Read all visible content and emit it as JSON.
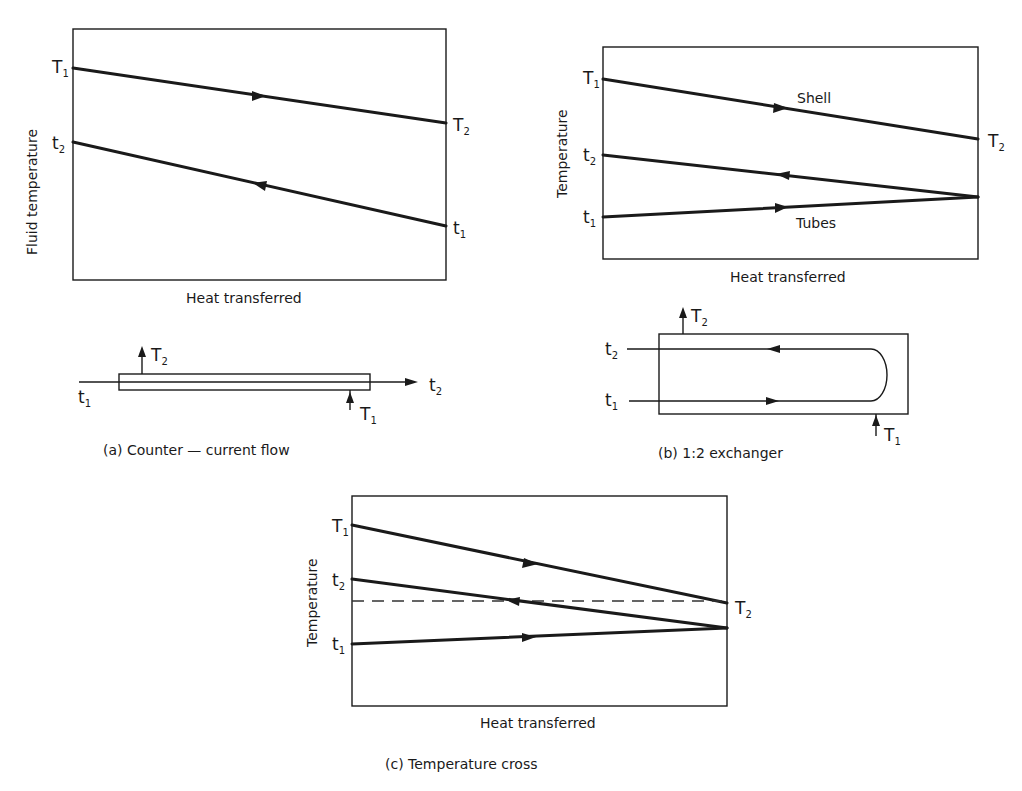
{
  "figure_a": {
    "caption": "(a)  Counter — current flow",
    "y_axis_label": "Fluid temperature",
    "x_axis_label": "Heat transferred",
    "labels": {
      "T1_main": "T",
      "T1_sub": "1",
      "T2_main": "T",
      "T2_sub": "2",
      "t2_main": "t",
      "t2_sub": "2",
      "t1_main": "t",
      "t1_sub": "1"
    },
    "schematic": {
      "T2_main": "T",
      "T2_sub": "2",
      "t1_main": "t",
      "t1_sub": "1",
      "t2_main": "t",
      "t2_sub": "2",
      "T1_main": "T",
      "T1_sub": "1"
    }
  },
  "figure_b": {
    "caption": "(b)  1:2 exchanger",
    "y_axis_label": "Temperature",
    "x_axis_label": "Heat transferred",
    "shell_label": "Shell",
    "tubes_label": "Tubes",
    "labels": {
      "T1_main": "T",
      "T1_sub": "1",
      "T2_main": "T",
      "T2_sub": "2",
      "t2_main": "t",
      "t2_sub": "2",
      "t1_main": "t",
      "t1_sub": "1"
    },
    "schematic": {
      "T2_main": "T",
      "T2_sub": "2",
      "t2_main": "t",
      "t2_sub": "2",
      "t1_main": "t",
      "t1_sub": "1",
      "T1_main": "T",
      "T1_sub": "1"
    }
  },
  "figure_c": {
    "caption": "(c)  Temperature cross",
    "y_axis_label": "Temperature",
    "x_axis_label": "Heat transferred",
    "labels": {
      "T1_main": "T",
      "T1_sub": "1",
      "T2_main": "T",
      "T2_sub": "2",
      "t2_main": "t",
      "t2_sub": "2",
      "t1_main": "t",
      "t1_sub": "1"
    }
  },
  "colors": {
    "ink": "#1a1a1a",
    "paper": "#ffffff"
  }
}
